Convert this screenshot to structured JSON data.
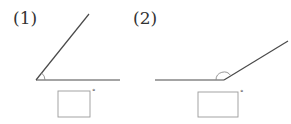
{
  "figures": [
    {
      "label": "(1)",
      "angle_type": "acute",
      "answer_box": "",
      "degree_symbol": "°"
    },
    {
      "label": "(2)",
      "angle_type": "obtuse",
      "answer_box": "",
      "degree_symbol": "°"
    }
  ],
  "colors": {
    "line": "#4a4a4a",
    "arc": "#8a8a8a",
    "box": "#9a9a9a"
  }
}
